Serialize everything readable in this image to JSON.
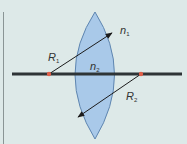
{
  "diagram": {
    "type": "biconvex-lens-cross-section",
    "colors": {
      "background": "#dde9e8",
      "lens_fill": "#a9c9e9",
      "lens_stroke": "#5f86b0",
      "axis": "#2e3436",
      "center_points": "#e0604a",
      "arrows": "#1c1c1c",
      "left_rule": "#8a9595"
    },
    "labels": {
      "r1": {
        "main": "R",
        "sub": "1"
      },
      "r2": {
        "main": "R",
        "sub": "2"
      },
      "n1": {
        "main": "n",
        "sub": "1"
      },
      "n2": {
        "main": "n",
        "sub": "2"
      }
    },
    "elements": [
      {
        "name": "optical-axis",
        "kind": "line"
      },
      {
        "name": "lens",
        "kind": "biconvex",
        "medium_index": "n2"
      },
      {
        "name": "center-of-curvature-1",
        "kind": "point"
      },
      {
        "name": "center-of-curvature-2",
        "kind": "point"
      },
      {
        "name": "radius-arrow-1",
        "label": "R1"
      },
      {
        "name": "radius-arrow-2",
        "label": "R2"
      }
    ]
  }
}
